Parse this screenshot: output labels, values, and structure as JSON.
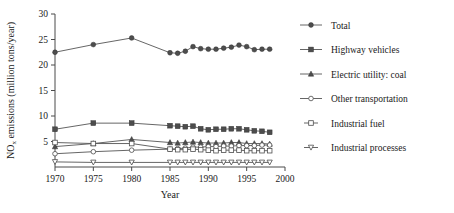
{
  "chart_data": {
    "type": "line",
    "title": "",
    "xlabel": "Year",
    "ylabel": "NO_x emissions (million tons/year)",
    "ylabel_main": "NO",
    "ylabel_sub": "x",
    "ylabel_rest": " emissions (million tons/year)",
    "xlim": [
      1970,
      2000
    ],
    "ylim": [
      0,
      30
    ],
    "xticks": [
      1970,
      1975,
      1980,
      1985,
      1990,
      1995,
      2000
    ],
    "yticks": [
      5,
      10,
      15,
      20,
      25,
      30
    ],
    "grid": false,
    "legend_position": "right",
    "x": [
      1970,
      1975,
      1980,
      1985,
      1986,
      1987,
      1988,
      1989,
      1990,
      1991,
      1992,
      1993,
      1994,
      1995,
      1996,
      1997,
      1998
    ],
    "series": [
      {
        "name": "Total",
        "marker": "filled-circle",
        "values": [
          22.5,
          24.0,
          25.3,
          22.4,
          22.3,
          22.7,
          23.6,
          23.2,
          23.1,
          23.1,
          23.3,
          23.5,
          23.9,
          23.6,
          23.0,
          23.1,
          23.1
        ]
      },
      {
        "name": "Highway vehicles",
        "marker": "filled-square",
        "values": [
          7.4,
          8.6,
          8.6,
          8.1,
          8.0,
          7.9,
          8.0,
          7.5,
          7.3,
          7.4,
          7.4,
          7.5,
          7.5,
          7.3,
          7.1,
          7.0,
          6.8
        ]
      },
      {
        "name": "Electric utility: coal",
        "marker": "filled-triangle",
        "values": [
          4.0,
          4.6,
          5.4,
          4.8,
          4.7,
          4.8,
          4.9,
          4.8,
          4.7,
          4.7,
          4.7,
          4.8,
          4.8,
          4.6,
          4.6,
          4.6,
          4.5
        ]
      },
      {
        "name": "Other transportation",
        "marker": "open-circle",
        "values": [
          2.6,
          3.0,
          3.3,
          3.5,
          3.6,
          3.7,
          3.9,
          3.9,
          4.0,
          4.0,
          4.1,
          4.1,
          4.2,
          4.2,
          4.2,
          4.3,
          4.3
        ]
      },
      {
        "name": "Industrial fuel",
        "marker": "open-square",
        "values": [
          4.8,
          4.6,
          4.6,
          3.5,
          3.4,
          3.4,
          3.5,
          3.4,
          3.3,
          3.2,
          3.3,
          3.3,
          3.3,
          3.2,
          3.2,
          3.2,
          3.2
        ]
      },
      {
        "name": "Industrial processes",
        "marker": "open-triangle-down",
        "values": [
          1.0,
          0.9,
          0.9,
          0.9,
          0.9,
          0.9,
          0.9,
          0.9,
          0.9,
          0.9,
          0.9,
          0.9,
          0.9,
          0.9,
          0.9,
          0.9,
          0.9
        ]
      }
    ]
  },
  "legend": {
    "items": [
      {
        "label": "Total",
        "marker": "filled-circle"
      },
      {
        "label": "Highway vehicles",
        "marker": "filled-square"
      },
      {
        "label": "Electric utility: coal",
        "marker": "filled-triangle"
      },
      {
        "label": "Other transportation",
        "marker": "open-circle"
      },
      {
        "label": "Industrial fuel",
        "marker": "open-square"
      },
      {
        "label": "Industrial processes",
        "marker": "open-triangle-down"
      }
    ]
  }
}
